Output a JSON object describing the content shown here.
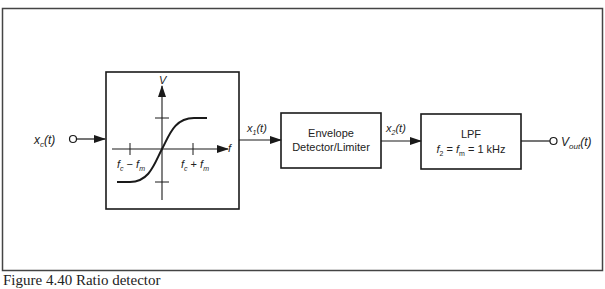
{
  "figure": {
    "caption": "Figure 4.40  Ratio detector"
  },
  "input": {
    "label_main": "x",
    "label_sub": "c",
    "label_arg": "(t)"
  },
  "discriminator_block": {
    "y_axis_label": "V",
    "x_axis_label": "f",
    "tick_left_label": {
      "a": "f",
      "a_sub": "c",
      "op": " − ",
      "b": "f",
      "b_sub": "m"
    },
    "tick_right_label": {
      "a": "f",
      "a_sub": "c",
      "op": " + ",
      "b": "f",
      "b_sub": "m"
    }
  },
  "signal_x1": {
    "main": "x",
    "sub": "1",
    "arg": "(t)"
  },
  "envelope_block": {
    "line1": "Envelope",
    "line2": "Detector/Limiter"
  },
  "signal_x2": {
    "main": "x",
    "sub": "2",
    "arg": "(t)"
  },
  "lpf_block": {
    "line1": "LPF",
    "eq_f2": "f",
    "eq_f2_sub": "2",
    "eq_eq1": " = ",
    "eq_fm": "f",
    "eq_fm_sub": "m",
    "eq_rest": " = 1 kHz"
  },
  "output": {
    "label_main": "V",
    "label_sub": "out",
    "label_arg": "(t)"
  }
}
